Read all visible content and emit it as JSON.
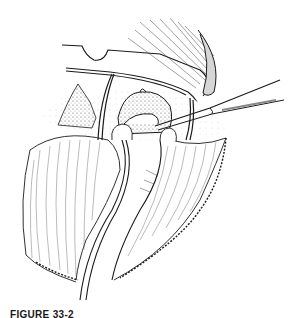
{
  "figure": {
    "caption_label": "FIGURE 33-2",
    "caption_rest": "",
    "colors": {
      "ink": "#1a1a1a",
      "background": "#ffffff",
      "stipple": "#8a8a8a"
    }
  }
}
